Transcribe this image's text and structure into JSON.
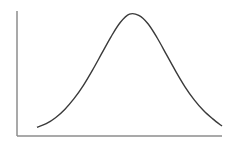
{
  "chart_data": {
    "type": "line",
    "title": "",
    "xlabel": "",
    "ylabel": "",
    "grid": false,
    "legend": null,
    "x": [
      0,
      1,
      2,
      3,
      4,
      5,
      6,
      7,
      8,
      9,
      10,
      11,
      12,
      13,
      14,
      15,
      16,
      17,
      18,
      19,
      20
    ],
    "values": [
      0.04,
      0.07,
      0.12,
      0.19,
      0.28,
      0.39,
      0.52,
      0.66,
      0.8,
      0.92,
      0.99,
      0.98,
      0.91,
      0.79,
      0.65,
      0.51,
      0.38,
      0.27,
      0.18,
      0.11,
      0.05
    ],
    "xlim": [
      0,
      20
    ],
    "ylim": [
      0,
      1
    ],
    "colors": {
      "curve": "#3a3a3a",
      "axis": "#8c8c8c"
    }
  }
}
